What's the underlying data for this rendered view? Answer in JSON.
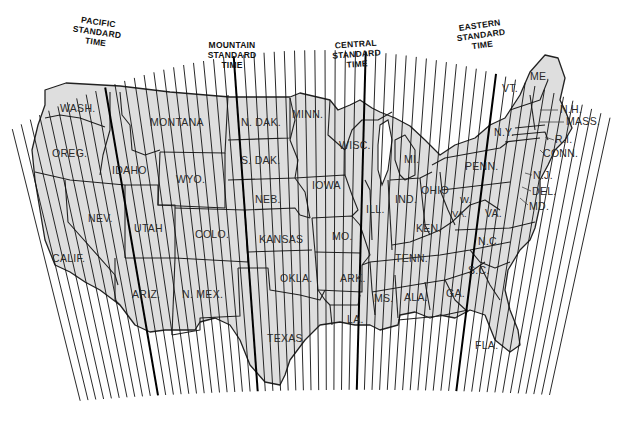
{
  "map": {
    "title": "US Standard Time Zones",
    "background_color": "#ffffff",
    "land_color": "#dedede",
    "line_color": "#111111",
    "time_zones": [
      {
        "id": "pacific",
        "line1": "PACIFIC",
        "line2": "STANDARD",
        "line3": "TIME"
      },
      {
        "id": "mountain",
        "line1": "MOUNTAIN",
        "line2": "STANDARD",
        "line3": "TIME"
      },
      {
        "id": "central",
        "line1": "CENTRAL",
        "line2": "STANDARD",
        "line3": "TIME"
      },
      {
        "id": "eastern",
        "line1": "EASTERN",
        "line2": "STANDARD",
        "line3": "TIME"
      }
    ],
    "states": {
      "wash": "WASH.",
      "oreg": "OREG.",
      "calif": "CALIF.",
      "idaho": "IDAHO",
      "nev": "NEV.",
      "montana": "MONTANA",
      "wyo": "WYO.",
      "utah": "UTAH",
      "ariz": "ARIZ.",
      "colo": "COLO.",
      "nmex": "N. MEX.",
      "ndak": "N. DAK.",
      "sdak": "S. DAK.",
      "neb": "NEB.",
      "kansas": "KANSAS",
      "okla": "OKLA.",
      "texas": "TEXAS",
      "minn": "MINN.",
      "iowa": "IOWA",
      "mo": "MO.",
      "ark": "ARK.",
      "la": "LA.",
      "wisc": "WISC.",
      "ill": "ILL.",
      "mi": "MI.",
      "ind": "IND.",
      "ohio": "OHIO",
      "ken": "KEN.",
      "tenn": "TENN.",
      "ms": "MS.",
      "ala": "ALA.",
      "ga": "GA.",
      "fla": "FLA.",
      "sc": "S.C.",
      "nc": "N.C.",
      "va": "VA.",
      "wva_w": "W.",
      "wva_va": "VA.",
      "penn": "PENN.",
      "ny": "N.Y.",
      "vt": "VT.",
      "me": "ME.",
      "nh": "N.H.",
      "mass": "MASS.",
      "ri": "R.I.",
      "conn": "CONN.",
      "nj": "N.J.",
      "del": "DEL.",
      "md": "MD."
    }
  }
}
